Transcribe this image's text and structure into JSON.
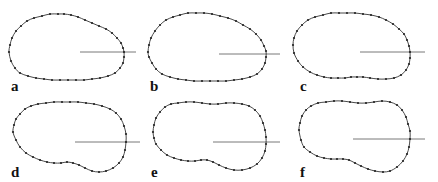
{
  "figure": {
    "stroke_color": "#333333",
    "point_color": "#222222",
    "line_color": "#555555",
    "panels": [
      {
        "label": "a",
        "label_pos": [
          11,
          79
        ],
        "ref_line": [
          80,
          52,
          136,
          52
        ],
        "points": [
          [
            9,
            52
          ],
          [
            10,
            45
          ],
          [
            12,
            38
          ],
          [
            16,
            31
          ],
          [
            21,
            26
          ],
          [
            27,
            21
          ],
          [
            34,
            18
          ],
          [
            42,
            16
          ],
          [
            50,
            14
          ],
          [
            58,
            14
          ],
          [
            64,
            14
          ],
          [
            71,
            15
          ],
          [
            78,
            17
          ],
          [
            85,
            20
          ],
          [
            92,
            23
          ],
          [
            99,
            26
          ],
          [
            106,
            29
          ],
          [
            112,
            33
          ],
          [
            117,
            38
          ],
          [
            121,
            43
          ],
          [
            123,
            48
          ],
          [
            124,
            52
          ],
          [
            124,
            57
          ],
          [
            123,
            63
          ],
          [
            120,
            68
          ],
          [
            115,
            73
          ],
          [
            108,
            76
          ],
          [
            100,
            78
          ],
          [
            92,
            79
          ],
          [
            84,
            80
          ],
          [
            76,
            80
          ],
          [
            68,
            80
          ],
          [
            60,
            80
          ],
          [
            52,
            80
          ],
          [
            44,
            79
          ],
          [
            36,
            78
          ],
          [
            28,
            76
          ],
          [
            20,
            73
          ],
          [
            15,
            68
          ],
          [
            11,
            61
          ]
        ]
      },
      {
        "label": "b",
        "label_pos": [
          150,
          79
        ],
        "ref_line": [
          219,
          54,
          280,
          54
        ],
        "points": [
          [
            148,
            52
          ],
          [
            149,
            45
          ],
          [
            151,
            38
          ],
          [
            155,
            31
          ],
          [
            160,
            25
          ],
          [
            166,
            20
          ],
          [
            173,
            17
          ],
          [
            180,
            15
          ],
          [
            188,
            13
          ],
          [
            196,
            13
          ],
          [
            204,
            13
          ],
          [
            212,
            14
          ],
          [
            220,
            16
          ],
          [
            228,
            18
          ],
          [
            236,
            21
          ],
          [
            243,
            25
          ],
          [
            250,
            29
          ],
          [
            256,
            34
          ],
          [
            261,
            40
          ],
          [
            264,
            46
          ],
          [
            266,
            51
          ],
          [
            266,
            57
          ],
          [
            265,
            63
          ],
          [
            262,
            69
          ],
          [
            257,
            74
          ],
          [
            250,
            77
          ],
          [
            242,
            79
          ],
          [
            234,
            80
          ],
          [
            226,
            81
          ],
          [
            218,
            81
          ],
          [
            210,
            81
          ],
          [
            202,
            81
          ],
          [
            194,
            81
          ],
          [
            186,
            80
          ],
          [
            178,
            79
          ],
          [
            170,
            77
          ],
          [
            162,
            74
          ],
          [
            156,
            69
          ],
          [
            152,
            63
          ],
          [
            149,
            57
          ]
        ]
      },
      {
        "label": "c",
        "label_pos": [
          300,
          79
        ],
        "ref_line": [
          360,
          52,
          425,
          52
        ],
        "points": [
          [
            293,
            45
          ],
          [
            294,
            38
          ],
          [
            297,
            31
          ],
          [
            302,
            25
          ],
          [
            308,
            20
          ],
          [
            315,
            17
          ],
          [
            323,
            15
          ],
          [
            331,
            13
          ],
          [
            339,
            13
          ],
          [
            347,
            13
          ],
          [
            355,
            13
          ],
          [
            363,
            14
          ],
          [
            371,
            15
          ],
          [
            379,
            17
          ],
          [
            386,
            20
          ],
          [
            393,
            24
          ],
          [
            399,
            29
          ],
          [
            404,
            34
          ],
          [
            407,
            40
          ],
          [
            409,
            46
          ],
          [
            410,
            52
          ],
          [
            410,
            58
          ],
          [
            409,
            64
          ],
          [
            406,
            70
          ],
          [
            401,
            75
          ],
          [
            394,
            78
          ],
          [
            386,
            79
          ],
          [
            378,
            79
          ],
          [
            370,
            78
          ],
          [
            363,
            77
          ],
          [
            357,
            77
          ],
          [
            351,
            77
          ],
          [
            345,
            78
          ],
          [
            338,
            78
          ],
          [
            331,
            78
          ],
          [
            324,
            77
          ],
          [
            317,
            75
          ],
          [
            310,
            72
          ],
          [
            303,
            67
          ],
          [
            298,
            61
          ],
          [
            294,
            53
          ]
        ]
      },
      {
        "label": "d",
        "label_pos": [
          11,
          165
        ],
        "ref_line": [
          75,
          142,
          140,
          142
        ],
        "points": [
          [
            13,
            132
          ],
          [
            14,
            125
          ],
          [
            16,
            119
          ],
          [
            20,
            114
          ],
          [
            25,
            109
          ],
          [
            31,
            106
          ],
          [
            38,
            104
          ],
          [
            46,
            103
          ],
          [
            54,
            102
          ],
          [
            62,
            102
          ],
          [
            70,
            102
          ],
          [
            78,
            102
          ],
          [
            86,
            103
          ],
          [
            94,
            104
          ],
          [
            102,
            106
          ],
          [
            110,
            109
          ],
          [
            116,
            113
          ],
          [
            121,
            119
          ],
          [
            124,
            126
          ],
          [
            126,
            134
          ],
          [
            126,
            142
          ],
          [
            125,
            150
          ],
          [
            123,
            157
          ],
          [
            119,
            163
          ],
          [
            113,
            168
          ],
          [
            106,
            171
          ],
          [
            99,
            172
          ],
          [
            92,
            171
          ],
          [
            85,
            168
          ],
          [
            79,
            165
          ],
          [
            73,
            163
          ],
          [
            67,
            162
          ],
          [
            61,
            163
          ],
          [
            54,
            163
          ],
          [
            47,
            162
          ],
          [
            40,
            160
          ],
          [
            33,
            157
          ],
          [
            26,
            153
          ],
          [
            20,
            147
          ],
          [
            16,
            140
          ]
        ]
      },
      {
        "label": "e",
        "label_pos": [
          151,
          165
        ],
        "ref_line": [
          213,
          142,
          280,
          142
        ],
        "points": [
          [
            153,
            132
          ],
          [
            154,
            125
          ],
          [
            156,
            118
          ],
          [
            160,
            112
          ],
          [
            165,
            107
          ],
          [
            171,
            104
          ],
          [
            178,
            103
          ],
          [
            186,
            102
          ],
          [
            194,
            102
          ],
          [
            202,
            103
          ],
          [
            210,
            104
          ],
          [
            218,
            104
          ],
          [
            226,
            103
          ],
          [
            234,
            103
          ],
          [
            242,
            104
          ],
          [
            249,
            106
          ],
          [
            255,
            110
          ],
          [
            260,
            116
          ],
          [
            263,
            123
          ],
          [
            265,
            130
          ],
          [
            266,
            137
          ],
          [
            266,
            144
          ],
          [
            265,
            151
          ],
          [
            262,
            158
          ],
          [
            257,
            164
          ],
          [
            250,
            168
          ],
          [
            242,
            170
          ],
          [
            234,
            170
          ],
          [
            226,
            168
          ],
          [
            219,
            165
          ],
          [
            213,
            162
          ],
          [
            207,
            160
          ],
          [
            201,
            160
          ],
          [
            195,
            161
          ],
          [
            188,
            161
          ],
          [
            181,
            160
          ],
          [
            174,
            158
          ],
          [
            167,
            155
          ],
          [
            161,
            150
          ],
          [
            156,
            144
          ],
          [
            154,
            138
          ]
        ]
      },
      {
        "label": "f",
        "label_pos": [
          300,
          165
        ],
        "ref_line": [
          353,
          139,
          425,
          139
        ],
        "points": [
          [
            299,
            130
          ],
          [
            300,
            123
          ],
          [
            302,
            116
          ],
          [
            306,
            110
          ],
          [
            311,
            106
          ],
          [
            318,
            103
          ],
          [
            326,
            102
          ],
          [
            334,
            101
          ],
          [
            342,
            101
          ],
          [
            350,
            102
          ],
          [
            358,
            103
          ],
          [
            366,
            103
          ],
          [
            374,
            102
          ],
          [
            382,
            101
          ],
          [
            390,
            102
          ],
          [
            397,
            105
          ],
          [
            402,
            110
          ],
          [
            406,
            117
          ],
          [
            408,
            124
          ],
          [
            410,
            131
          ],
          [
            410,
            139
          ],
          [
            409,
            147
          ],
          [
            407,
            154
          ],
          [
            403,
            161
          ],
          [
            397,
            167
          ],
          [
            390,
            171
          ],
          [
            383,
            172
          ],
          [
            375,
            171
          ],
          [
            368,
            169
          ],
          [
            361,
            166
          ],
          [
            355,
            163
          ],
          [
            349,
            160
          ],
          [
            343,
            159
          ],
          [
            337,
            159
          ],
          [
            331,
            159
          ],
          [
            324,
            158
          ],
          [
            317,
            156
          ],
          [
            310,
            152
          ],
          [
            304,
            147
          ],
          [
            301,
            140
          ]
        ]
      }
    ]
  }
}
